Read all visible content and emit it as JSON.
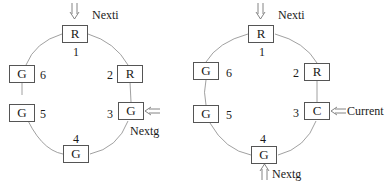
{
  "diagrams": [
    {
      "nodes": [
        {
          "id": "1",
          "state": "R"
        },
        {
          "id": "2",
          "state": "R"
        },
        {
          "id": "3",
          "state": "G"
        },
        {
          "id": "4",
          "state": "G"
        },
        {
          "id": "5",
          "state": "G"
        },
        {
          "id": "6",
          "state": "G"
        }
      ],
      "pointers": {
        "nexti": "Nexti",
        "nextg": "Nextg"
      }
    },
    {
      "nodes": [
        {
          "id": "1",
          "state": "R"
        },
        {
          "id": "2",
          "state": "R"
        },
        {
          "id": "3",
          "state": "C"
        },
        {
          "id": "4",
          "state": "G"
        },
        {
          "id": "5",
          "state": "G"
        },
        {
          "id": "6",
          "state": "G"
        }
      ],
      "pointers": {
        "nexti": "Nexti",
        "current": "Current",
        "nextg": "Nextg"
      }
    }
  ],
  "colors": {
    "line": "#777777",
    "box_border": "#555555",
    "text": "#1a1a1a"
  }
}
